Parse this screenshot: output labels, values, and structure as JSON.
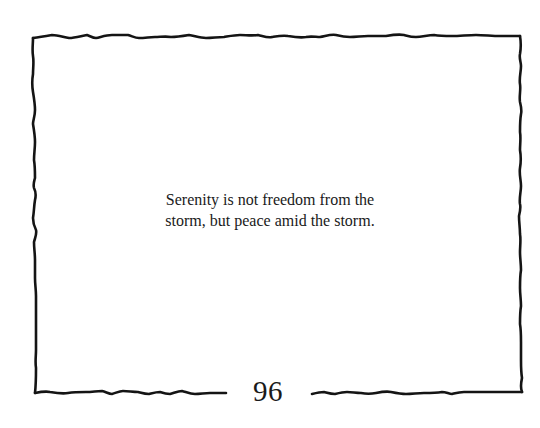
{
  "page": {
    "quote": {
      "lines": [
        "Serenity is not freedom from the",
        "storm, but peace amid the storm."
      ]
    },
    "page_number": "96",
    "colors": {
      "background": "#ffffff",
      "ink": "#1a1a1a"
    },
    "decorations": {
      "border": "hand-drawn-wavy-frame"
    }
  }
}
